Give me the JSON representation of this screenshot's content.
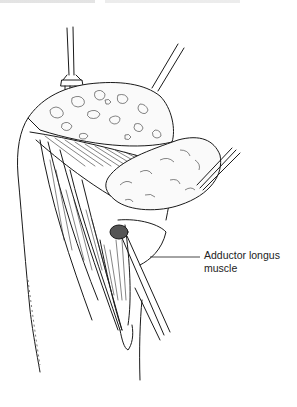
{
  "figure": {
    "type": "surgical-illustration",
    "labels": [
      {
        "id": "adductor-longus",
        "lines": [
          "Adductor longus",
          "muscle"
        ],
        "leader": {
          "x1": 150,
          "y1": 257,
          "x2": 200,
          "y2": 257
        }
      }
    ],
    "instruments": [
      "retractor-left",
      "retractor-right",
      "forceps",
      "probe"
    ],
    "colors": {
      "ink": "#1a1a1a",
      "background": "#ffffff"
    }
  }
}
